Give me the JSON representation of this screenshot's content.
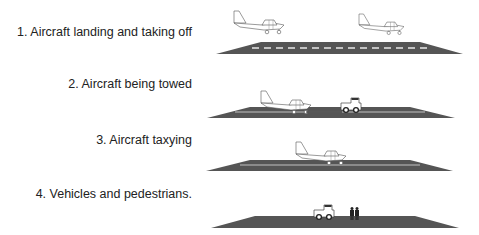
{
  "scenes": [
    {
      "label": "1. Aircraft landing and taking off",
      "objects": [
        "aircraft-landing",
        "aircraft-taking-off",
        "runway-with-centerline-dashes"
      ]
    },
    {
      "label": "2. Aircraft being towed",
      "objects": [
        "aircraft",
        "tow-tractor",
        "runway"
      ]
    },
    {
      "label": "3. Aircraft taxying",
      "objects": [
        "aircraft",
        "runway"
      ]
    },
    {
      "label": "4. Vehicles and pedestrians.",
      "objects": [
        "vehicle",
        "pedestrians",
        "runway"
      ]
    }
  ],
  "colors": {
    "runway": "#555555",
    "centerline": "#e8e8e8",
    "outline": "#444444"
  }
}
